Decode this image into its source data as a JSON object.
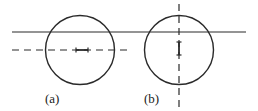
{
  "figure": {
    "colors": {
      "stroke": "#2a2a2a",
      "background": "#ffffff"
    },
    "panels": [
      {
        "id": "a",
        "label": "(a)",
        "axis": "horizontal-dashed",
        "marker": "I (horizontal)"
      },
      {
        "id": "b",
        "label": "(b)",
        "axis": "vertical-dashed",
        "marker": "I (vertical)"
      }
    ]
  }
}
